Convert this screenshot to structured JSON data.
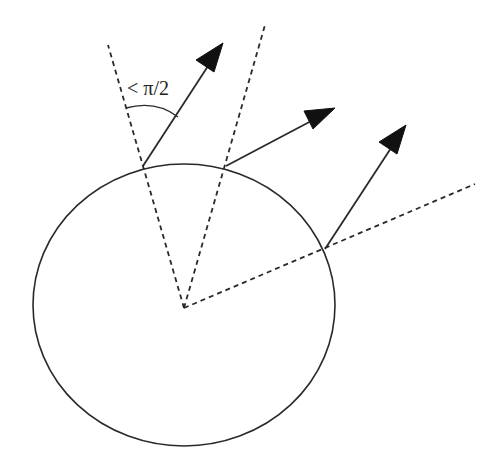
{
  "diagram": {
    "angle_label": "< π/2",
    "colors": {
      "stroke": "#2a2a2a",
      "arrowhead": "#111111",
      "background": "#ffffff"
    },
    "circle": {
      "cx": 184,
      "cy": 305,
      "rx": 151,
      "ry": 141
    },
    "center": {
      "x": 184,
      "y": 308
    },
    "dashed_rays": [
      {
        "name": "left-cone-boundary",
        "x1": 184,
        "y1": 308,
        "x2": 108,
        "y2": 45
      },
      {
        "name": "right-cone-boundary",
        "x1": 184,
        "y1": 308,
        "x2": 265,
        "y2": 25
      },
      {
        "name": "right-normal-ray",
        "x1": 184,
        "y1": 308,
        "x2": 475,
        "y2": 184
      }
    ],
    "arrows": [
      {
        "name": "arrow-1",
        "x1": 143,
        "y1": 166,
        "x2": 223,
        "y2": 43
      },
      {
        "name": "arrow-2",
        "x1": 226,
        "y1": 166,
        "x2": 335,
        "y2": 108
      },
      {
        "name": "arrow-3",
        "x1": 325,
        "y1": 249,
        "x2": 406,
        "y2": 125
      }
    ],
    "angle_arc": {
      "x1": 126,
      "y1": 108,
      "x2": 178,
      "y2": 117
    }
  }
}
